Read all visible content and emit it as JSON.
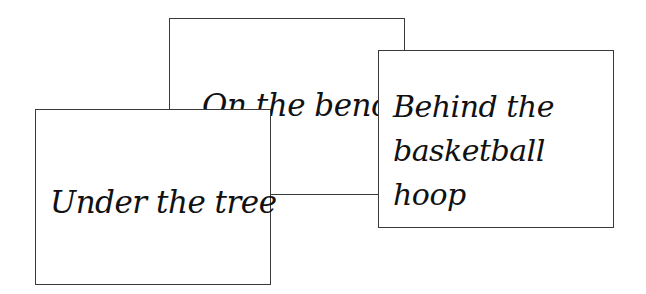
{
  "cards": [
    {
      "id": "bench",
      "label": "On the bench"
    },
    {
      "id": "tree",
      "label": "Under the tree"
    },
    {
      "id": "hoop",
      "label": "Behind the basketball hoop"
    }
  ]
}
